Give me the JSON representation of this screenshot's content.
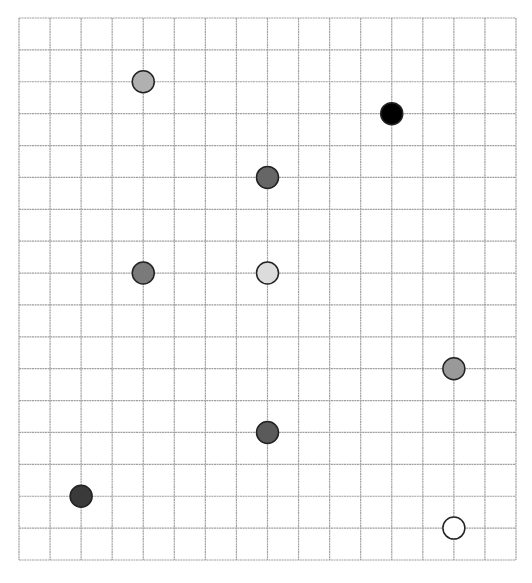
{
  "grid": {
    "columns": 16,
    "rows": 17,
    "left": 19,
    "top": 18,
    "right": 516,
    "bottom": 560,
    "line_color": "#a0a0a0"
  },
  "circles": [
    {
      "col": 4,
      "row": 2,
      "fill": "#b0b0b0"
    },
    {
      "col": 12,
      "row": 3,
      "fill": "#000000"
    },
    {
      "col": 8,
      "row": 5,
      "fill": "#666666"
    },
    {
      "col": 4,
      "row": 8,
      "fill": "#7a7a7a"
    },
    {
      "col": 8,
      "row": 8,
      "fill": "#dcdcdc"
    },
    {
      "col": 14,
      "row": 11,
      "fill": "#999999"
    },
    {
      "col": 8,
      "row": 13,
      "fill": "#5a5a5a"
    },
    {
      "col": 2,
      "row": 15,
      "fill": "#3a3a3a"
    },
    {
      "col": 14,
      "row": 16,
      "fill": "#ffffff"
    }
  ],
  "circle_radius": 11,
  "circle_stroke": "#222222"
}
